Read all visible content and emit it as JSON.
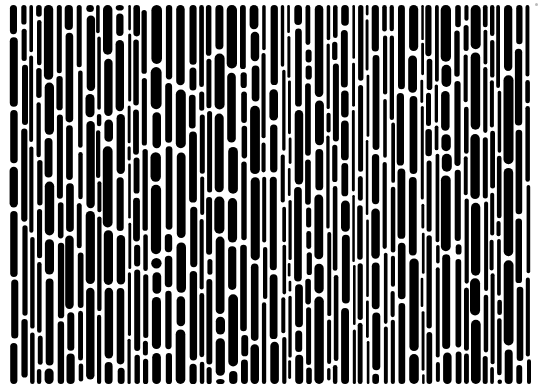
{
  "image": {
    "description": "Black-and-white abstract pattern of vertically elongated rounded black blobs separated by white channels",
    "width": 542,
    "height": 387,
    "background": "#ffffff",
    "foreground": "#000000",
    "pattern_bounds": {
      "x": 9,
      "y": 5,
      "width": 521,
      "height": 379
    },
    "blob": {
      "min_width": 3,
      "max_width": 11,
      "min_length": 10,
      "max_length": 95,
      "gap": 2.5,
      "slant": 0.04
    },
    "seed": 1337
  }
}
